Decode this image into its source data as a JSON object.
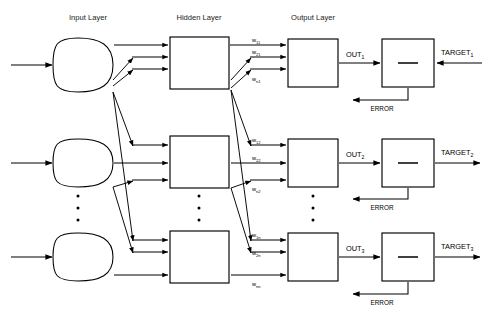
{
  "diagram": {
    "layers": [
      {
        "id": "input",
        "label": "Input Layer",
        "x": 88
      },
      {
        "id": "hidden",
        "label": "Hidden Layer",
        "x": 199
      },
      {
        "id": "output",
        "label": "Output Layer",
        "x": 313
      }
    ],
    "rows": [
      {
        "index": 1,
        "out_label": "OUT",
        "out_sub": "1",
        "target_label": "TARGET",
        "target_sub": "1",
        "error_label": "ERROR",
        "operator": "minus",
        "target_direction": "left",
        "weights": [
          {
            "label": "w",
            "sub": "11"
          },
          {
            "label": "w",
            "sub": "21"
          },
          {
            "label": "w",
            "sub": "n1"
          }
        ]
      },
      {
        "index": 2,
        "out_label": "OUT",
        "out_sub": "2",
        "target_label": "TARGET",
        "target_sub": "2",
        "error_label": "ERROR",
        "operator": "minus",
        "target_direction": "right",
        "weights": [
          {
            "label": "w",
            "sub": "12"
          },
          {
            "label": "w",
            "sub": "22"
          },
          {
            "label": "w",
            "sub": "n2"
          }
        ]
      },
      {
        "index": 3,
        "out_label": "OUT",
        "out_sub": "3",
        "target_label": "TARGET",
        "target_sub": "3",
        "error_label": "ERROR",
        "operator": "minus",
        "target_direction": "right",
        "weights": [
          {
            "label": "w",
            "sub": "1n"
          },
          {
            "label": "w",
            "sub": "2n"
          },
          {
            "label": "w",
            "sub": "nn"
          }
        ]
      }
    ],
    "ellipsis": {
      "symbol": "•",
      "count": 3,
      "columns": [
        "input",
        "hidden",
        "output"
      ]
    },
    "colors": {
      "stroke": "#000000",
      "fill": "#ffffff",
      "text": "#1a1a1a",
      "background": "#ffffff"
    }
  }
}
